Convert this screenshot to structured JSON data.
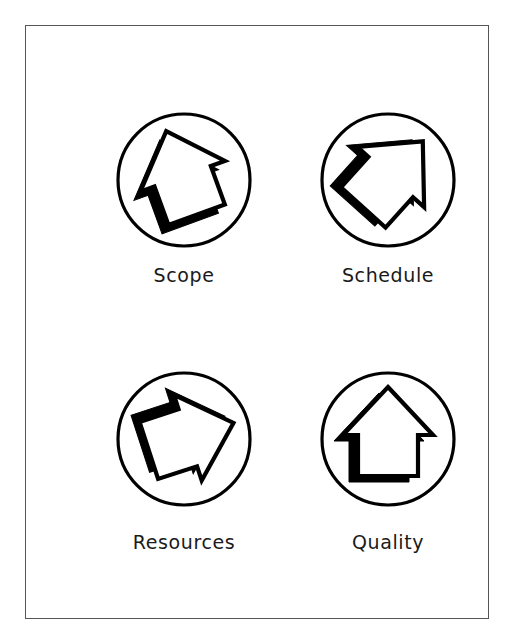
{
  "figure": {
    "background_color": "#ffffff",
    "frame_color": "#555555",
    "stroke_color": "#000000",
    "shadow_color": "#000000",
    "fill_color": "#ffffff",
    "label_color": "#1a1a1a"
  },
  "diagram": {
    "type": "icon-grid",
    "rows": 2,
    "columns": 2,
    "shape": "circle-with-3d-up-arrow",
    "items": [
      {
        "id": "scope",
        "label": "Scope",
        "icon_name": "circled-up-arrow-icon",
        "arrow_rotation_deg": -20,
        "circle": {
          "cx": 100,
          "cy": 76,
          "r": 67
        }
      },
      {
        "id": "schedule",
        "label": "Schedule",
        "icon_name": "circled-up-right-arrow-icon",
        "arrow_rotation_deg": 42,
        "circle": {
          "cx": 100,
          "cy": 76,
          "r": 67
        }
      },
      {
        "id": "resources",
        "label": "Resources",
        "icon_name": "circled-right-arrow-icon",
        "arrow_rotation_deg": 72,
        "circle": {
          "cx": 100,
          "cy": 76,
          "r": 67
        }
      },
      {
        "id": "quality",
        "label": "Quality",
        "icon_name": "circled-up-arrow-icon",
        "arrow_rotation_deg": 0,
        "circle": {
          "cx": 100,
          "cy": 76,
          "r": 67
        }
      }
    ]
  }
}
